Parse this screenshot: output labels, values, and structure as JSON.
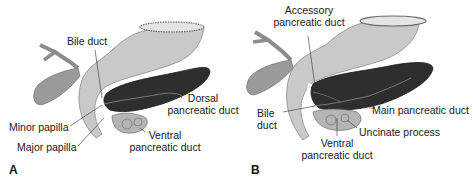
{
  "figure": {
    "panels": [
      {
        "letter": "A",
        "labels": {
          "bile_duct": "Bile duct",
          "dorsal_duct_1": "Dorsal",
          "dorsal_duct_2": "pancreatic duct",
          "minor_papilla": "Minor papilla",
          "major_papilla": "Major papilla",
          "ventral_duct_1": "Ventral",
          "ventral_duct_2": "pancreatic duct"
        }
      },
      {
        "letter": "B",
        "labels": {
          "accessory_duct_1": "Accessory",
          "accessory_duct_2": "pancreatic duct",
          "bile_duct_1": "Bile",
          "bile_duct_2": "duct",
          "main_duct": "Main pancreatic duct",
          "uncinate": "Uncinate process",
          "ventral_duct_1": "Ventral",
          "ventral_duct_2": "pancreatic duct"
        }
      }
    ],
    "colors": {
      "duodenum": "#c9c9c9",
      "duodenum_edge": "#8a8a8a",
      "pancreas": "#2e2e2e",
      "gallbladder": "#9a9a9a",
      "ventral_bud": "#b5b5b5",
      "leader_line": "#333333"
    }
  }
}
